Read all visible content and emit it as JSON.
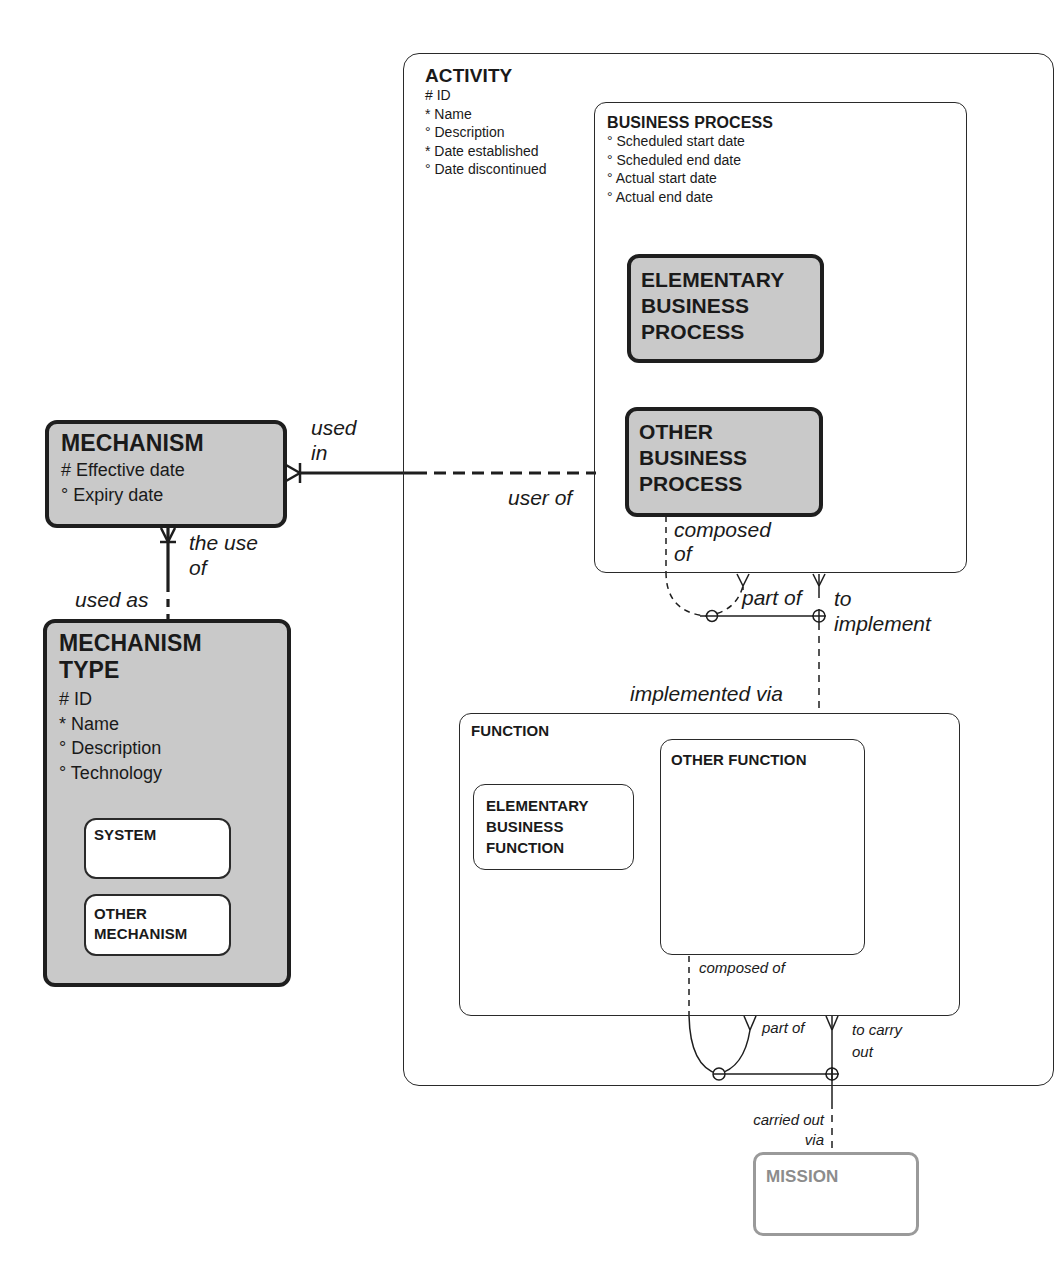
{
  "entities": {
    "activity": {
      "title": "ACTIVITY",
      "attributes": [
        "# ID",
        "* Name",
        "° Description",
        "* Date established",
        "° Date discontinued"
      ]
    },
    "business_process": {
      "title": "BUSINESS PROCESS",
      "attributes": [
        "° Scheduled start date",
        "° Scheduled end date",
        "° Actual start date",
        "° Actual end date"
      ]
    },
    "elementary_business_process": {
      "title": "ELEMENTARY\nBUSINESS\nPROCESS"
    },
    "other_business_process": {
      "title": "OTHER\nBUSINESS\nPROCESS"
    },
    "function": {
      "title": "FUNCTION"
    },
    "elementary_business_function": {
      "title": "ELEMENTARY\nBUSINESS\nFUNCTION"
    },
    "other_function": {
      "title": "OTHER FUNCTION"
    },
    "mechanism": {
      "title": "MECHANISM",
      "attributes": [
        "# Effective date",
        "° Expiry date"
      ]
    },
    "mechanism_type": {
      "title": "MECHANISM\nTYPE",
      "attributes": [
        "# ID",
        "* Name",
        "° Description",
        "° Technology"
      ]
    },
    "system": {
      "title": "SYSTEM"
    },
    "other_mechanism": {
      "title": "OTHER\nMECHANISM"
    },
    "mission": {
      "title": "MISSION"
    }
  },
  "relationships": {
    "mechanism_process": {
      "from_label": "used\nin",
      "to_label": "user of"
    },
    "mechanism_type": {
      "from_label": "the use\nof",
      "to_label": "used as"
    },
    "process_recursion": {
      "composed_label": "composed\nof",
      "part_label": "part of"
    },
    "process_function": {
      "process_label": "to\nimplement",
      "function_label": "implemented via"
    },
    "function_recursion": {
      "composed_label": "composed of",
      "part_label": "part of"
    },
    "function_mission": {
      "function_label": "to carry\nout",
      "mission_label": "carried out\nvia"
    }
  },
  "colors": {
    "line": "#1e1e1e",
    "shaded_fill": "#c9c9c9",
    "ghost": "#9a9a9a"
  }
}
